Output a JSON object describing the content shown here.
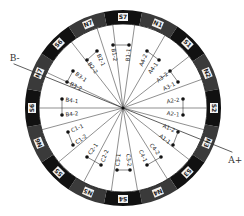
{
  "diagram": {
    "type": "motor-winding-diagram",
    "center": {
      "x": 123,
      "y": 108
    },
    "ring": {
      "outer_radius": 98,
      "inner_radius": 84,
      "color_dark": "#111111",
      "color_mid": "#3a3a3a"
    },
    "axes": [
      {
        "label": "A+",
        "angle_deg": 22
      },
      {
        "label": "B-",
        "angle_deg": 202
      }
    ],
    "poles": [
      {
        "label": "S7",
        "angle_deg": -90
      },
      {
        "label": "N1",
        "angle_deg": -67.5
      },
      {
        "label": "S1",
        "angle_deg": -45
      },
      {
        "label": "N2",
        "angle_deg": -22.5
      },
      {
        "label": "S2",
        "angle_deg": 0
      },
      {
        "label": "N3",
        "angle_deg": 22.5
      },
      {
        "label": "S3",
        "angle_deg": 45
      },
      {
        "label": "N4",
        "angle_deg": 67.5
      },
      {
        "label": "S4",
        "angle_deg": 90
      },
      {
        "label": "N5",
        "angle_deg": 112.5
      },
      {
        "label": "S5",
        "angle_deg": 135
      },
      {
        "label": "N6",
        "angle_deg": 157.5
      },
      {
        "label": "S6",
        "angle_deg": 180
      },
      {
        "label": "N7",
        "angle_deg": 202.5
      },
      {
        "label": "S6",
        "angle_deg": 225
      },
      {
        "label": "N7",
        "angle_deg": 247.5
      }
    ],
    "spokes_deg": [
      -97,
      -82,
      -60,
      -38,
      -20,
      0,
      15,
      38,
      58,
      80,
      98,
      118,
      140,
      165,
      180,
      205,
      232,
      252
    ],
    "coils": [
      {
        "label": "A4-2",
        "x": 147,
        "y": 51,
        "rot": 68
      },
      {
        "label": "A4-1",
        "x": 159,
        "y": 60,
        "rot": 60
      },
      {
        "label": "A3-2",
        "x": 170,
        "y": 71,
        "rot": 45
      },
      {
        "label": "A3-1",
        "x": 178,
        "y": 82,
        "rot": 30
      },
      {
        "label": "A2-2",
        "x": 183,
        "y": 99,
        "rot": 0
      },
      {
        "label": "A2-1",
        "x": 183,
        "y": 115,
        "rot": 0
      },
      {
        "label": "A1-2",
        "x": 178,
        "y": 132,
        "rot": -25
      },
      {
        "label": "A1-1",
        "x": 173,
        "y": 145,
        "rot": -40
      },
      {
        "label": "C4-2",
        "x": 161,
        "y": 157,
        "rot": -60
      },
      {
        "label": "C4-1",
        "x": 147,
        "y": 165,
        "rot": -68
      },
      {
        "label": "C3-2",
        "x": 130,
        "y": 170,
        "rot": -90
      },
      {
        "label": "C3-1",
        "x": 117,
        "y": 170,
        "rot": -90
      },
      {
        "label": "C2-2",
        "x": 101,
        "y": 165,
        "rot": -110
      },
      {
        "label": "C2-1",
        "x": 87,
        "y": 157,
        "rot": -120
      },
      {
        "label": "C1-2",
        "x": 73,
        "y": 145,
        "rot": -140
      },
      {
        "label": "C1-1",
        "x": 68,
        "y": 132,
        "rot": -155
      },
      {
        "label": "B4-2",
        "x": 62,
        "y": 115,
        "rot": 180
      },
      {
        "label": "B4-1",
        "x": 62,
        "y": 99,
        "rot": 180
      },
      {
        "label": "B3-2",
        "x": 67,
        "y": 82,
        "rot": 155
      },
      {
        "label": "B3-1",
        "x": 73,
        "y": 71,
        "rot": 140
      },
      {
        "label": "B2-2",
        "x": 87,
        "y": 60,
        "rot": 120
      },
      {
        "label": "B2-1",
        "x": 97,
        "y": 51,
        "rot": 112
      },
      {
        "label": "B1-2",
        "x": 113,
        "y": 45,
        "rot": 90
      },
      {
        "label": "B1-1",
        "x": 129,
        "y": 45,
        "rot": 90
      }
    ]
  }
}
